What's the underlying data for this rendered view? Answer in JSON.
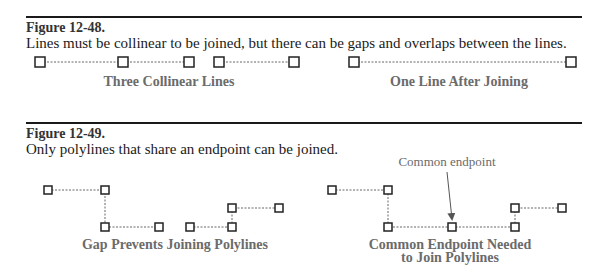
{
  "figures": [
    {
      "number": "Figure 12-48.",
      "caption": "Lines must be collinear to be joined, but there can be gaps and overlaps between the lines.",
      "panels": [
        {
          "label": "Three Collinear Lines",
          "lines": [
            [
              [
                40,
                62
              ],
              [
                123,
                62
              ]
            ],
            [
              [
                123,
                62
              ],
              [
                189,
                62
              ]
            ],
            [
              [
                219,
                62
              ],
              [
                294,
                62
              ]
            ]
          ]
        },
        {
          "label": "One Line After Joining",
          "lines": [
            [
              [
                354,
                62
              ],
              [
                571,
                62
              ]
            ]
          ]
        }
      ]
    },
    {
      "number": "Figure 12-49.",
      "caption": "Only polylines that share an endpoint can be joined.",
      "panels": [
        {
          "label": "Gap Prevents Joining Polylines",
          "polylines": [
            [
              [
                48,
                190
              ],
              [
                105,
                190
              ],
              [
                105,
                227
              ],
              [
                159,
                227
              ]
            ],
            [
              [
                190,
                227
              ],
              [
                232,
                227
              ],
              [
                232,
                208
              ],
              [
                279,
                208
              ]
            ]
          ]
        },
        {
          "label_line1": "Common Endpoint Needed",
          "label_line2": "to Join Polylines",
          "annotation": "Common endpoint",
          "polylines": [
            [
              [
                332,
                190
              ],
              [
                388,
                190
              ],
              [
                388,
                227
              ],
              [
                452,
                227
              ]
            ],
            [
              [
                452,
                227
              ],
              [
                515,
                227
              ],
              [
                515,
                208
              ],
              [
                562,
                208
              ]
            ]
          ]
        }
      ]
    }
  ]
}
